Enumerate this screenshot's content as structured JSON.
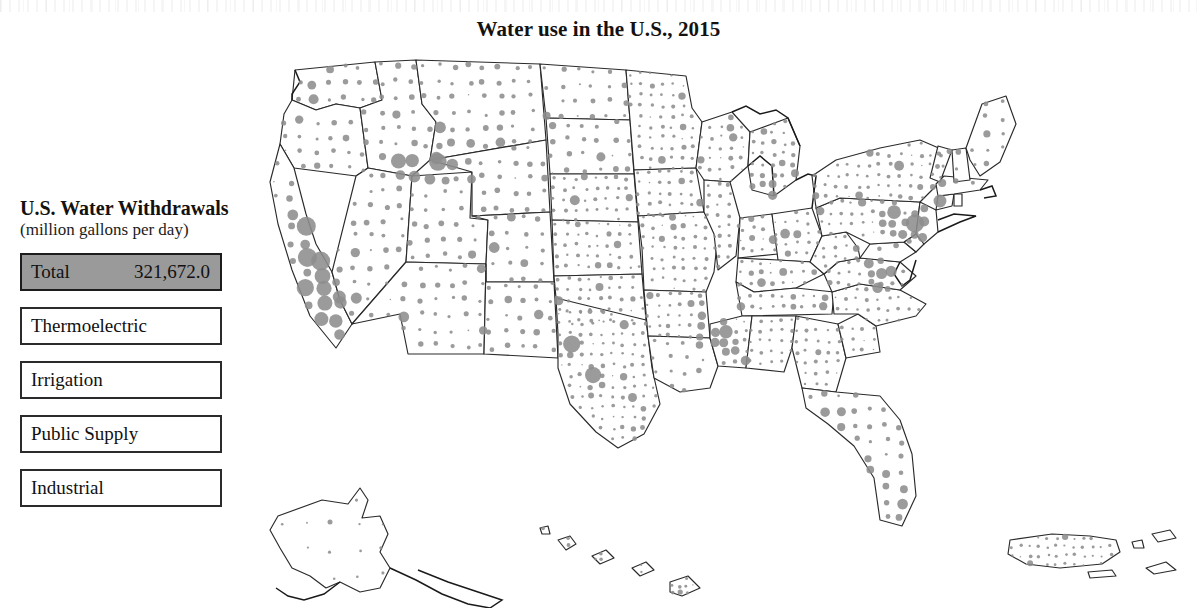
{
  "title": "Water use in the U.S., 2015",
  "legend": {
    "heading": "U.S. Water Withdrawals",
    "subheading": "(million gallons per day)",
    "selected_category": "Total",
    "rows": [
      {
        "label": "Total",
        "value": "321,672.0",
        "selected": true
      },
      {
        "label": "Thermoelectric",
        "value": "",
        "selected": false
      },
      {
        "label": "Irrigation",
        "value": "",
        "selected": false
      },
      {
        "label": "Public Supply",
        "value": "",
        "selected": false
      },
      {
        "label": "Industrial",
        "value": "",
        "selected": false
      }
    ]
  },
  "colors": {
    "dot": "#8d8d8d",
    "selected_row_fill": "#9a9a9a",
    "border": "#2b2b2b",
    "state_outline": "#2a2a2a",
    "background": "#ffffff",
    "text": "#111111"
  },
  "chart_data": {
    "type": "map",
    "map_type": "proportional-symbol",
    "title": "Water use in the U.S., 2015",
    "units": "million gallons per day",
    "symbol": "graduated circle, one per county, area proportional to withdrawal",
    "symbol_color": "#8d8d8d",
    "projection": "Albers USA (contiguous states, Alaska and Hawaii insets, Puerto Rico inset)",
    "legend_position": "left",
    "grid": false,
    "categories": [
      "Total",
      "Thermoelectric",
      "Irrigation",
      "Public Supply",
      "Industrial"
    ],
    "values": [
      321672.0,
      null,
      null,
      null,
      null
    ],
    "active_series": "Total",
    "active_value": 321672.0,
    "regions_shown": [
      "Contiguous United States",
      "Alaska",
      "Hawaii",
      "Puerto Rico",
      "U.S. Virgin Islands"
    ],
    "notable_clusters": [
      {
        "region": "California Central Valley",
        "intensity": "very high"
      },
      {
        "region": "Snake River Plain, Idaho",
        "intensity": "very high"
      },
      {
        "region": "Mississippi Delta",
        "intensity": "very high"
      },
      {
        "region": "Northeast Corridor",
        "intensity": "very high"
      },
      {
        "region": "Florida coasts",
        "intensity": "high"
      },
      {
        "region": "Texas Gulf Coast",
        "intensity": "high"
      },
      {
        "region": "Great Lakes shoreline",
        "intensity": "high"
      },
      {
        "region": "Alaska and Hawaii",
        "intensity": "low"
      }
    ]
  }
}
